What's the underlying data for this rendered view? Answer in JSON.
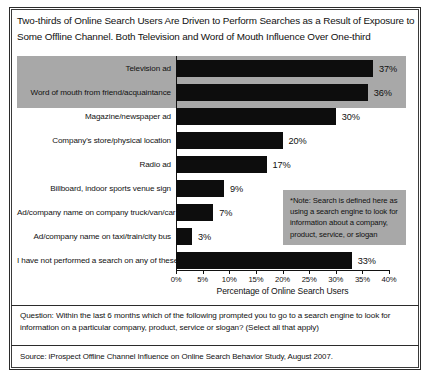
{
  "title": "Two-thirds of Online Search Users Are Driven to Perform Searches as a Result of Exposure to Some Offline Channel.  Both Television and Word of Mouth Influence Over One-third",
  "note": "*Note: Search is defined here as using a search engine to look for information about a company, product, service, or slogan",
  "question": "Question: Within the last 6 months which of the following prompted you to go to a search engine to look for information on a particular company, product, service or slogan?  (Select all that apply)",
  "source": "Source: iProspect Offline Channel Influence on Online Search Behavior Study, August 2007.",
  "colors": {
    "bar": "#0d0d0d",
    "highlight": "#a8a8a8",
    "frame": "#2b2b2b",
    "text": "#111111",
    "background": "#ffffff"
  },
  "chart_data": {
    "type": "bar",
    "orientation": "horizontal",
    "title": "Two-thirds of Online Search Users Are Driven to Perform Searches as a Result of Exposure to Some Offline Channel.  Both Television and Word of Mouth Influence Over One-third",
    "xlabel": "Percentage of Online Search Users",
    "ylabel": "",
    "xlim": [
      0,
      40
    ],
    "xtick_labels": [
      "0%",
      "5%",
      "10%",
      "15%",
      "20%",
      "25%",
      "30%",
      "35%",
      "40%"
    ],
    "xticks": [
      0,
      5,
      10,
      15,
      20,
      25,
      30,
      35,
      40
    ],
    "grid": false,
    "legend": "none",
    "value_suffix": "%",
    "highlighted_categories": [
      "Television ad",
      "Word of mouth from friend/acquaintance"
    ],
    "categories": [
      "Television ad",
      "Word of mouth from friend/acquaintance",
      "Magazine/newspaper ad",
      "Company's store/physical location",
      "Radio ad",
      "Billboard, indoor sports venue sign",
      "Ad/company name on company truck/van/car",
      "Ad/company name on taxi/train/city bus",
      "I have not performed a search on any of these"
    ],
    "values": [
      37,
      36,
      30,
      20,
      17,
      9,
      7,
      3,
      33
    ],
    "value_labels": [
      "37%",
      "36%",
      "30%",
      "20%",
      "17%",
      "9%",
      "7%",
      "3%",
      "33%"
    ]
  }
}
